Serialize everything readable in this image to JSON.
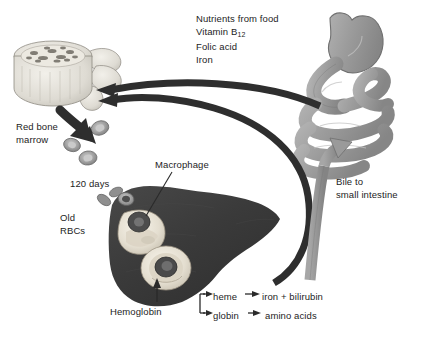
{
  "diagram": {
    "nutrients": {
      "line1": "Nutrients from food",
      "line2_prefix": "Vitamin B",
      "line2_sub": "12",
      "line3": "Folic acid",
      "line4": "Iron"
    },
    "labels": {
      "red_bone_marrow_line1": "Red bone",
      "red_bone_marrow_line2": "marrow",
      "lifespan": "120 days",
      "old_rbcs_line1": "Old",
      "old_rbcs_line2": "RBCs",
      "macrophage": "Macrophage",
      "hemoglobin": "Hemoglobin",
      "bile_line1": "Bile to",
      "bile_line2": "small intestine"
    },
    "breakdown": {
      "heme": "heme",
      "heme_products": "iron  +  bilirubin",
      "globin": "globin",
      "globin_products": "amino acids"
    },
    "colors": {
      "background": "#ffffff",
      "text": "#1d1d1d",
      "liver_dark": "#3b3b3b",
      "organ_gray": "#9d9d9d",
      "organ_gray_light": "#b4b4b4",
      "bone_light": "#e2e0da",
      "arrow_black": "#2a2a2a",
      "arrow_gray": "#8e8e8e",
      "rbc_fill": "#a9a9a9",
      "macrophage_fill": "#efeade"
    }
  }
}
